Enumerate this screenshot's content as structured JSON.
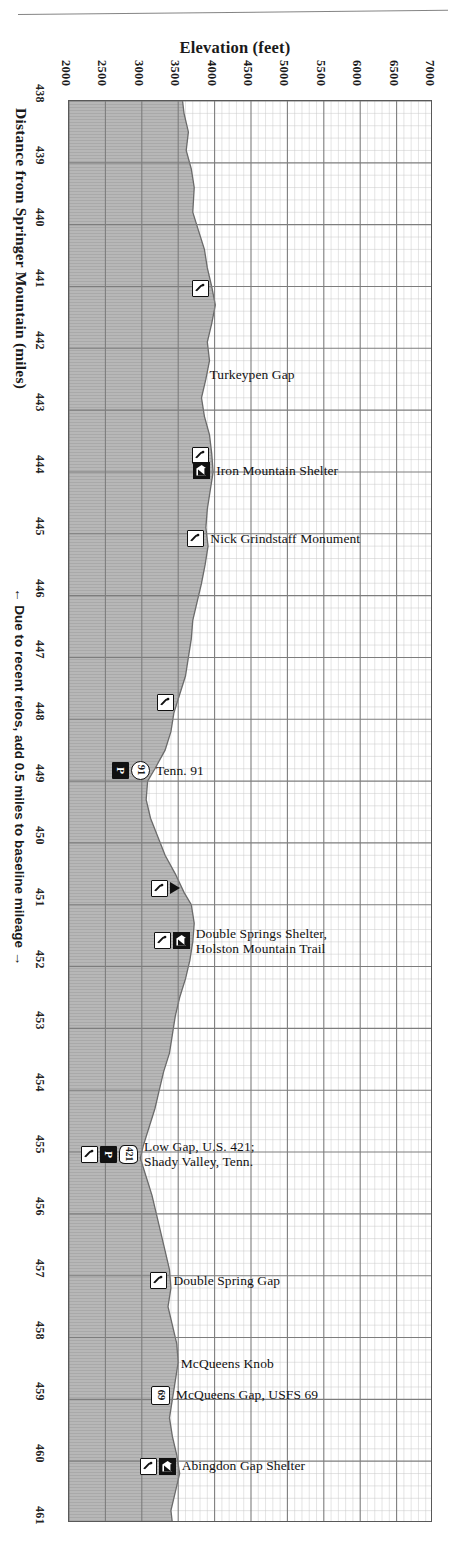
{
  "chart_data": {
    "type": "area",
    "xlabel": "Elevation (feet)",
    "ylabel": "Distance from Springer Mountain (miles)",
    "orientation": "horizontal-elevation-vertical-distance",
    "elevation_axis": {
      "label": "Elevation (feet)",
      "ticks": [
        2000,
        2500,
        3000,
        3500,
        4000,
        4500,
        5000,
        5500,
        6000,
        6500,
        7000
      ],
      "tick_labels": [
        "2000",
        "2500",
        "3000",
        "3500",
        "4000",
        "4500",
        "5000",
        "5500",
        "6000",
        "6500",
        "7000"
      ],
      "min": 2000,
      "max": 7000,
      "major_step": 500,
      "minor_step": 100
    },
    "distance_axis": {
      "label": "Distance from Springer Mountain (miles)",
      "ticks": [
        438,
        439,
        440,
        441,
        442,
        443,
        444,
        445,
        446,
        447,
        448,
        449,
        450,
        451,
        452,
        453,
        454,
        455,
        456,
        457,
        458,
        459,
        460,
        461
      ],
      "tick_labels": [
        "438",
        "439",
        "440",
        "441",
        "442",
        "443",
        "444",
        "445",
        "446",
        "447",
        "448",
        "449",
        "450",
        "451",
        "452",
        "453",
        "454",
        "455",
        "456",
        "457",
        "458",
        "459",
        "460",
        "461"
      ],
      "min": 438,
      "max": 461,
      "major_step": 1,
      "minor_step": 0.2
    },
    "grid": true,
    "legend": null,
    "note": "← Due to recent relos, add 0.5 miles to baseline mileage →",
    "profile_points": [
      {
        "mile": 438.0,
        "elevation": 3560
      },
      {
        "mile": 438.2,
        "elevation": 3580
      },
      {
        "mile": 438.5,
        "elevation": 3640
      },
      {
        "mile": 438.8,
        "elevation": 3610
      },
      {
        "mile": 439.1,
        "elevation": 3680
      },
      {
        "mile": 439.4,
        "elevation": 3720
      },
      {
        "mile": 439.8,
        "elevation": 3700
      },
      {
        "mile": 440.1,
        "elevation": 3780
      },
      {
        "mile": 440.4,
        "elevation": 3860
      },
      {
        "mile": 440.7,
        "elevation": 3900
      },
      {
        "mile": 441.0,
        "elevation": 3960
      },
      {
        "mile": 441.3,
        "elevation": 4010
      },
      {
        "mile": 441.6,
        "elevation": 3960
      },
      {
        "mile": 441.9,
        "elevation": 3900
      },
      {
        "mile": 442.2,
        "elevation": 3930
      },
      {
        "mile": 442.5,
        "elevation": 3880
      },
      {
        "mile": 442.8,
        "elevation": 3820
      },
      {
        "mile": 443.1,
        "elevation": 3860
      },
      {
        "mile": 443.4,
        "elevation": 3930
      },
      {
        "mile": 443.7,
        "elevation": 3960
      },
      {
        "mile": 444.0,
        "elevation": 3980
      },
      {
        "mile": 444.3,
        "elevation": 3940
      },
      {
        "mile": 444.6,
        "elevation": 3900
      },
      {
        "mile": 444.9,
        "elevation": 3880
      },
      {
        "mile": 445.2,
        "elevation": 3910
      },
      {
        "mile": 445.5,
        "elevation": 3870
      },
      {
        "mile": 445.8,
        "elevation": 3820
      },
      {
        "mile": 446.1,
        "elevation": 3760
      },
      {
        "mile": 446.4,
        "elevation": 3700
      },
      {
        "mile": 446.7,
        "elevation": 3680
      },
      {
        "mile": 447.0,
        "elevation": 3640
      },
      {
        "mile": 447.3,
        "elevation": 3600
      },
      {
        "mile": 447.6,
        "elevation": 3520
      },
      {
        "mile": 447.9,
        "elevation": 3440
      },
      {
        "mile": 448.2,
        "elevation": 3400
      },
      {
        "mile": 448.5,
        "elevation": 3320
      },
      {
        "mile": 448.8,
        "elevation": 3180
      },
      {
        "mile": 449.0,
        "elevation": 3080
      },
      {
        "mile": 449.3,
        "elevation": 3060
      },
      {
        "mile": 449.6,
        "elevation": 3120
      },
      {
        "mile": 449.9,
        "elevation": 3220
      },
      {
        "mile": 450.2,
        "elevation": 3320
      },
      {
        "mile": 450.5,
        "elevation": 3460
      },
      {
        "mile": 450.8,
        "elevation": 3580
      },
      {
        "mile": 451.0,
        "elevation": 3680
      },
      {
        "mile": 451.3,
        "elevation": 3720
      },
      {
        "mile": 451.6,
        "elevation": 3700
      },
      {
        "mile": 451.9,
        "elevation": 3660
      },
      {
        "mile": 452.2,
        "elevation": 3600
      },
      {
        "mile": 452.5,
        "elevation": 3520
      },
      {
        "mile": 452.8,
        "elevation": 3460
      },
      {
        "mile": 453.1,
        "elevation": 3420
      },
      {
        "mile": 453.4,
        "elevation": 3380
      },
      {
        "mile": 453.7,
        "elevation": 3300
      },
      {
        "mile": 454.0,
        "elevation": 3240
      },
      {
        "mile": 454.3,
        "elevation": 3180
      },
      {
        "mile": 454.6,
        "elevation": 3100
      },
      {
        "mile": 454.9,
        "elevation": 3020
      },
      {
        "mile": 455.1,
        "elevation": 2980
      },
      {
        "mile": 455.4,
        "elevation": 3060
      },
      {
        "mile": 455.7,
        "elevation": 3140
      },
      {
        "mile": 456.0,
        "elevation": 3200
      },
      {
        "mile": 456.3,
        "elevation": 3260
      },
      {
        "mile": 456.6,
        "elevation": 3320
      },
      {
        "mile": 456.9,
        "elevation": 3380
      },
      {
        "mile": 457.2,
        "elevation": 3400
      },
      {
        "mile": 457.5,
        "elevation": 3360
      },
      {
        "mile": 457.8,
        "elevation": 3420
      },
      {
        "mile": 458.1,
        "elevation": 3480
      },
      {
        "mile": 458.4,
        "elevation": 3500
      },
      {
        "mile": 458.7,
        "elevation": 3460
      },
      {
        "mile": 459.0,
        "elevation": 3420
      },
      {
        "mile": 459.3,
        "elevation": 3380
      },
      {
        "mile": 459.6,
        "elevation": 3420
      },
      {
        "mile": 459.9,
        "elevation": 3480
      },
      {
        "mile": 460.2,
        "elevation": 3520
      },
      {
        "mile": 460.5,
        "elevation": 3460
      },
      {
        "mile": 460.8,
        "elevation": 3400
      },
      {
        "mile": 461.0,
        "elevation": 3420
      }
    ],
    "features": [
      {
        "id": "f1",
        "mile": 441.05,
        "label": "",
        "symbols": [
          "water"
        ]
      },
      {
        "id": "f2",
        "mile": 442.45,
        "label": "Turkeypen Gap",
        "symbols": []
      },
      {
        "id": "f3",
        "mile": 443.75,
        "label": "",
        "symbols": [
          "water"
        ]
      },
      {
        "id": "f4",
        "mile": 444.0,
        "label": "Iron Mountain Shelter",
        "symbols": [
          "shelter"
        ]
      },
      {
        "id": "f5",
        "mile": 445.1,
        "label": "Nick Grindstaff Monument",
        "symbols": [
          "water"
        ]
      },
      {
        "id": "f6",
        "mile": 447.75,
        "label": "",
        "symbols": [
          "water"
        ]
      },
      {
        "id": "f7",
        "mile": 448.85,
        "label": "Tenn. 91",
        "symbols": [
          "parking",
          "shield-circle-91"
        ]
      },
      {
        "id": "f8",
        "mile": 450.75,
        "label": "",
        "symbols": [
          "water",
          "triangle"
        ]
      },
      {
        "id": "f9",
        "mile": 451.6,
        "label": "Double Springs Shelter,|Holston Mountain Trail",
        "symbols": [
          "water",
          "shelter"
        ]
      },
      {
        "id": "f10",
        "mile": 455.05,
        "label": "Low Gap, U.S. 421;|Shady Valley, Tenn.",
        "symbols": [
          "water",
          "parking",
          "shield-us-421"
        ]
      },
      {
        "id": "f11",
        "mile": 457.1,
        "label": "Double Spring Gap",
        "symbols": [
          "water"
        ]
      },
      {
        "id": "f12",
        "mile": 458.45,
        "label": "McQueens Knob",
        "symbols": []
      },
      {
        "id": "f13",
        "mile": 458.95,
        "label": "McQueens Gap, USFS 69",
        "symbols": [
          "shield-fs-69"
        ]
      },
      {
        "id": "f14",
        "mile": 460.1,
        "label": "Abingdon Gap Shelter",
        "symbols": [
          "water",
          "shelter"
        ]
      }
    ],
    "colors": {
      "terrain_fill": "#b7b7b7",
      "grid_major": "#7d7d7d",
      "grid_minor": "#c9c9c9",
      "border": "#595959",
      "text": "#111111"
    }
  },
  "axes": {
    "elevation_title": "Elevation (feet)",
    "distance_title": "Distance from Springer Mountain (miles)",
    "relo_note": "Due to recent relos, add 0.5 miles to baseline mileage",
    "arrow_left": "←",
    "arrow_right": "→"
  },
  "shield_values": {
    "tenn91": "91",
    "us421": "421",
    "usfs69": "69",
    "parking": "P"
  }
}
